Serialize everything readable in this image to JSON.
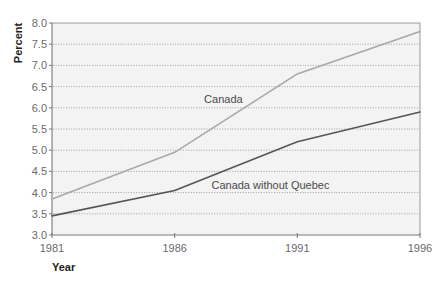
{
  "chart_data": {
    "type": "line",
    "title": "",
    "xlabel": "Year",
    "ylabel": "Percent",
    "x": [
      1981,
      1986,
      1991,
      1996
    ],
    "xlim": [
      1981,
      1996
    ],
    "ylim": [
      3.0,
      8.0
    ],
    "xticks": [
      "1981",
      "1986",
      "1991",
      "1996"
    ],
    "xtick_values": [
      1981,
      1986,
      1991,
      1996
    ],
    "yticks": [
      "3.0",
      "3.5",
      "4.0",
      "4.5",
      "5.0",
      "5.5",
      "6.0",
      "6.5",
      "7.0",
      "7.5",
      "8.0"
    ],
    "ytick_values": [
      3.0,
      3.5,
      4.0,
      4.5,
      5.0,
      5.5,
      6.0,
      6.5,
      7.0,
      7.5,
      8.0
    ],
    "grid": true,
    "legend": "inline labels on lines",
    "series": [
      {
        "name": "Canada",
        "values": [
          3.85,
          4.95,
          6.8,
          7.8
        ],
        "color": "#a8a8a8"
      },
      {
        "name": "Canada without Quebec",
        "values": [
          3.45,
          4.05,
          5.2,
          5.9
        ],
        "color": "#555555"
      }
    ],
    "annotations": [
      {
        "text": "Canada",
        "series": "Canada",
        "x": 1987.2,
        "y": 6.2
      },
      {
        "text": "Canada without Quebec",
        "series": "Canada without Quebec",
        "x": 1987.5,
        "y": 4.18
      }
    ],
    "colors": {
      "plot_background": "#f3f3f3",
      "page_background": "#ffffff"
    }
  }
}
